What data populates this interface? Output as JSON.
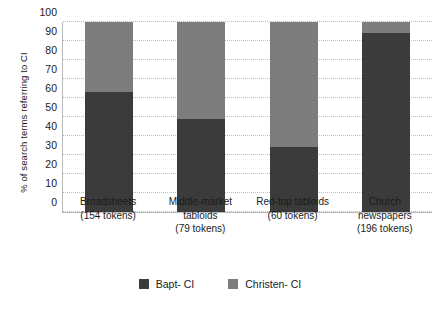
{
  "chart_data": {
    "type": "bar",
    "subtype": "stacked-bar-100",
    "title": "",
    "xlabel": "",
    "ylabel": "% of search terms referring to CI",
    "ylim": [
      0,
      100
    ],
    "ytick_step": 10,
    "yticks": [
      "100",
      "90",
      "80",
      "70",
      "60",
      "50",
      "40",
      "30",
      "20",
      "10",
      "0"
    ],
    "grid": true,
    "grid_axis": "y",
    "legend_position": "bottom-center",
    "categories": [
      "Broadsheets\n(154 tokens)",
      "Middle-market tabloids\n(79 tokens)",
      "Red-top tabloids\n(60 tokens)",
      "Church newspapers\n(196 tokens)"
    ],
    "category_lines": [
      [
        "Broadsheets",
        "(154 tokens)"
      ],
      [
        "Middle-market",
        "tabloids",
        "(79 tokens)"
      ],
      [
        "Red-top tabloids",
        "(60 tokens)"
      ],
      [
        "Church",
        "newspapers",
        "(196 tokens)"
      ]
    ],
    "token_counts": [
      154,
      79,
      60,
      196
    ],
    "series": [
      {
        "name": "Bapt- CI",
        "color": "#3b3b3b",
        "values": [
          63,
          49,
          34,
          94
        ]
      },
      {
        "name": "Christen- CI",
        "color": "#7d7d7d",
        "values": [
          37,
          51,
          66,
          6
        ]
      }
    ]
  },
  "legend": {
    "items": [
      {
        "label": "Bapt- CI",
        "color": "#3b3b3b"
      },
      {
        "label": "Christen- CI",
        "color": "#7d7d7d"
      }
    ]
  },
  "colors": {
    "dark_series": "#3b3b3b",
    "light_series": "#7d7d7d",
    "grid": "#bdbdbd",
    "axis": "#b9b9b9",
    "text": "#1a1a1a",
    "background": "#ffffff"
  }
}
